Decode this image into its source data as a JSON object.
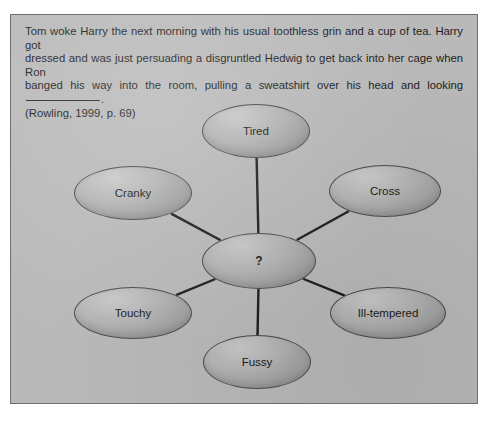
{
  "figure": {
    "prompt": {
      "line1": "Tom woke Harry the next morning with his usual toothless grin and a cup of tea. Harry got",
      "line2": "dressed and was just persuading a disgruntled Hedwig to get back into her cage when Ron",
      "line3_before_blank": "banged his way into the room, pulling a sweatshirt over his head and looking",
      "line3_after_blank": ".",
      "citation": "(Rowling, 1999, p. 69)"
    },
    "colors": {
      "panel_background": "#b9b9b9",
      "panel_border": "#6f6f6f",
      "node_fill": "#b2b2b2",
      "node_border": "#4a4a4a",
      "connector": "#1e1e1e",
      "text": "#1c1c1c"
    }
  },
  "chart_data": {
    "type": "diagram",
    "title": "",
    "center": {
      "label": "?",
      "cx": 248,
      "cy": 172,
      "rx": 57,
      "ry": 28
    },
    "nodes": [
      {
        "label": "Tired",
        "cx": 245,
        "cy": 42,
        "rx": 54,
        "ry": 27
      },
      {
        "label": "Cranky",
        "cx": 122,
        "cy": 104,
        "rx": 59,
        "ry": 27
      },
      {
        "label": "Cross",
        "cx": 374,
        "cy": 102,
        "rx": 56,
        "ry": 26
      },
      {
        "label": "Ill-tempered",
        "cx": 377,
        "cy": 224,
        "rx": 58,
        "ry": 26
      },
      {
        "label": "Touchy",
        "cx": 122,
        "cy": 224,
        "rx": 59,
        "ry": 26
      },
      {
        "label": "Fussy",
        "cx": 246,
        "cy": 273,
        "rx": 54,
        "ry": 27
      }
    ],
    "edges": [
      {
        "from": "?",
        "to": "Tired"
      },
      {
        "from": "?",
        "to": "Cranky"
      },
      {
        "from": "?",
        "to": "Cross"
      },
      {
        "from": "?",
        "to": "Ill-tempered"
      },
      {
        "from": "?",
        "to": "Touchy"
      },
      {
        "from": "?",
        "to": "Fussy"
      }
    ]
  }
}
